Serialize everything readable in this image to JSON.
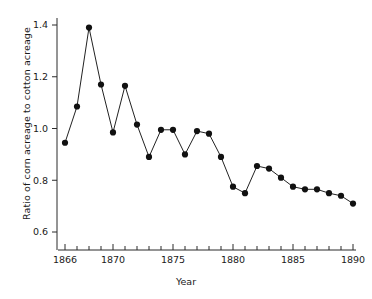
{
  "chart_data": {
    "type": "line",
    "title": "",
    "xlabel": "Year",
    "ylabel": "Ratio of corn acreage to cotton acreage",
    "x": [
      1866,
      1867,
      1868,
      1869,
      1870,
      1871,
      1872,
      1873,
      1874,
      1875,
      1876,
      1877,
      1878,
      1879,
      1880,
      1881,
      1882,
      1883,
      1884,
      1885,
      1886,
      1887,
      1888,
      1889,
      1890
    ],
    "values": [
      0.945,
      1.085,
      1.39,
      1.17,
      0.985,
      1.165,
      1.015,
      0.89,
      0.995,
      0.995,
      0.9,
      0.99,
      0.98,
      0.89,
      0.775,
      0.75,
      0.855,
      0.845,
      0.81,
      0.775,
      0.765,
      0.765,
      0.75,
      0.74,
      0.71
    ],
    "xlim": [
      1865.4,
      1890.6
    ],
    "ylim": [
      0.52,
      1.46
    ],
    "xticks": [
      1866,
      1867,
      1868,
      1869,
      1870,
      1871,
      1872,
      1873,
      1874,
      1875,
      1876,
      1877,
      1878,
      1879,
      1880,
      1881,
      1882,
      1883,
      1884,
      1885,
      1886,
      1887,
      1888,
      1889,
      1890
    ],
    "xtick_labels": [
      "1866",
      "",
      "",
      "",
      "1870",
      "",
      "",
      "",
      "",
      "1875",
      "",
      "",
      "",
      "",
      "1880",
      "",
      "",
      "",
      "",
      "1885",
      "",
      "",
      "",
      "",
      "1890"
    ],
    "yticks": [
      0.6,
      0.8,
      1.0,
      1.2,
      1.4
    ],
    "ytick_labels": [
      "0.6",
      "0.8",
      "1.0",
      "1.2",
      "1.4"
    ],
    "grid": false,
    "legend": null,
    "marker": "filled-circle",
    "line_color": "#222222",
    "marker_color": "#111111"
  }
}
